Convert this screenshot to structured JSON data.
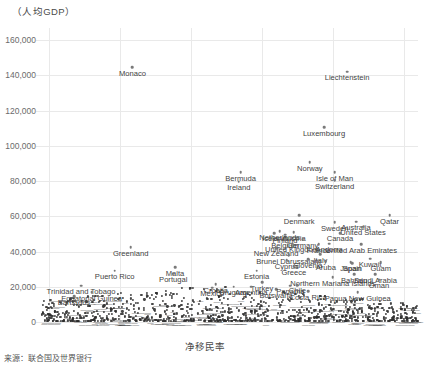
{
  "axis_title_y": "（人均GDP）",
  "axis_title_x": "净移民率",
  "source_note": "来源：联合国及世界银行",
  "chart_data": {
    "type": "scatter",
    "title": "",
    "xlabel": "净移民率",
    "ylabel": "（人均GDP）",
    "xlim": [
      -2,
      104
    ],
    "ylim": [
      0,
      160000
    ],
    "xticks": [
      "0",
      "20",
      "40",
      "60",
      "80",
      "100"
    ],
    "xtick_values": [
      0,
      20,
      40,
      60,
      80,
      100
    ],
    "yticks": [
      "0",
      "20,000",
      "40,000",
      "60,000",
      "80,000",
      "100,000",
      "120,000",
      "140,000",
      "160,000"
    ],
    "ytick_values": [
      0,
      20000,
      40000,
      60000,
      80000,
      100000,
      120000,
      140000,
      160000
    ],
    "grid": true,
    "legend": "none",
    "points": [
      {
        "label": "Monaco",
        "x": 23.5,
        "y": 144500
      },
      {
        "label": "Liechtenstein",
        "x": 84.0,
        "y": 142000
      },
      {
        "label": "Luxembourg",
        "x": 77.5,
        "y": 110500
      },
      {
        "label": "Norway",
        "x": 73.5,
        "y": 90500
      },
      {
        "label": "Isle of Man",
        "x": 80.5,
        "y": 85000
      },
      {
        "label": "Bermuda",
        "x": 54.0,
        "y": 85000
      },
      {
        "label": "Switzerland",
        "x": 80.5,
        "y": 80500
      },
      {
        "label": "Ireland",
        "x": 53.5,
        "y": 79500
      },
      {
        "label": "Qatar",
        "x": 96.0,
        "y": 60500
      },
      {
        "label": "Denmark",
        "x": 70.5,
        "y": 60500
      },
      {
        "label": "Sweden",
        "x": 80.5,
        "y": 56500
      },
      {
        "label": "Australia",
        "x": 86.5,
        "y": 57000
      },
      {
        "label": "United States",
        "x": 88.5,
        "y": 54000
      },
      {
        "label": "Netherlands",
        "x": 65.0,
        "y": 51500
      },
      {
        "label": "Austria",
        "x": 69.0,
        "y": 51000
      },
      {
        "label": "Canada",
        "x": 82.0,
        "y": 50500
      },
      {
        "label": "Finland",
        "x": 66.5,
        "y": 49500
      },
      {
        "label": "Iceland",
        "x": 63.5,
        "y": 50500
      },
      {
        "label": "Belgium",
        "x": 66.5,
        "y": 47000
      },
      {
        "label": "Germany",
        "x": 71.5,
        "y": 47000
      },
      {
        "label": "Andorra",
        "x": 79.0,
        "y": 44500
      },
      {
        "label": "United Arab Emirates",
        "x": 88.0,
        "y": 44000
      },
      {
        "label": "France",
        "x": 76.0,
        "y": 44000
      },
      {
        "label": "United Kingdom",
        "x": 68.5,
        "y": 44500
      },
      {
        "label": "New Zealand",
        "x": 64.0,
        "y": 42000
      },
      {
        "label": "Greenland",
        "x": 23.0,
        "y": 42500
      },
      {
        "label": "Italy",
        "x": 76.5,
        "y": 38500
      },
      {
        "label": "Brunei Darussalam",
        "x": 67.5,
        "y": 38000
      },
      {
        "label": "Kuwait",
        "x": 90.5,
        "y": 36000
      },
      {
        "label": "Cyprus",
        "x": 67.0,
        "y": 35000
      },
      {
        "label": "Slovenia",
        "x": 73.0,
        "y": 35500
      },
      {
        "label": "Aruba",
        "x": 78.0,
        "y": 34500
      },
      {
        "label": "Japan",
        "x": 85.0,
        "y": 34000
      },
      {
        "label": "Spain",
        "x": 85.5,
        "y": 33500
      },
      {
        "label": "Guam",
        "x": 93.5,
        "y": 34000
      },
      {
        "label": "Greece",
        "x": 69.0,
        "y": 31500
      },
      {
        "label": "Malta",
        "x": 35.5,
        "y": 31000
      },
      {
        "label": "Portugal",
        "x": 35.0,
        "y": 27500
      },
      {
        "label": "Puerto Rico",
        "x": 18.5,
        "y": 29000
      },
      {
        "label": "Estonia",
        "x": 58.5,
        "y": 29000
      },
      {
        "label": "Bahrain",
        "x": 86.0,
        "y": 27000
      },
      {
        "label": "Saudi Arabia",
        "x": 92.0,
        "y": 27000
      },
      {
        "label": "Northern Mariana Islands",
        "x": 80.0,
        "y": 25500
      },
      {
        "label": "Oman",
        "x": 93.0,
        "y": 24000
      },
      {
        "label": "Turkey",
        "x": 60.0,
        "y": 22500
      },
      {
        "label": "Trinidad and Tobago",
        "x": 9.0,
        "y": 20500
      },
      {
        "label": "Equatorial Guinea",
        "x": 12.0,
        "y": 17000
      },
      {
        "label": "Barbados",
        "x": 7.0,
        "y": 14500
      },
      {
        "label": "Botswana",
        "x": 64.0,
        "y": 18500
      },
      {
        "label": "Costa Rica",
        "x": 73.0,
        "y": 17500
      },
      {
        "label": "Papua New Guinea",
        "x": 87.0,
        "y": 17000
      },
      {
        "label": "Argentina",
        "x": 57.0,
        "y": 20000
      },
      {
        "label": "Mexico",
        "x": 46.0,
        "y": 19500
      },
      {
        "label": "Panama",
        "x": 68.0,
        "y": 20500
      },
      {
        "label": "Chile",
        "x": 70.0,
        "y": 21000
      },
      {
        "label": "Uruguay",
        "x": 52.0,
        "y": 20000
      },
      {
        "label": "Croatia",
        "x": 47.0,
        "y": 21500
      }
    ],
    "dense_cluster_note": "large unlabeled dense band of countries between x=0 and x=100 at y below ~20,000"
  }
}
